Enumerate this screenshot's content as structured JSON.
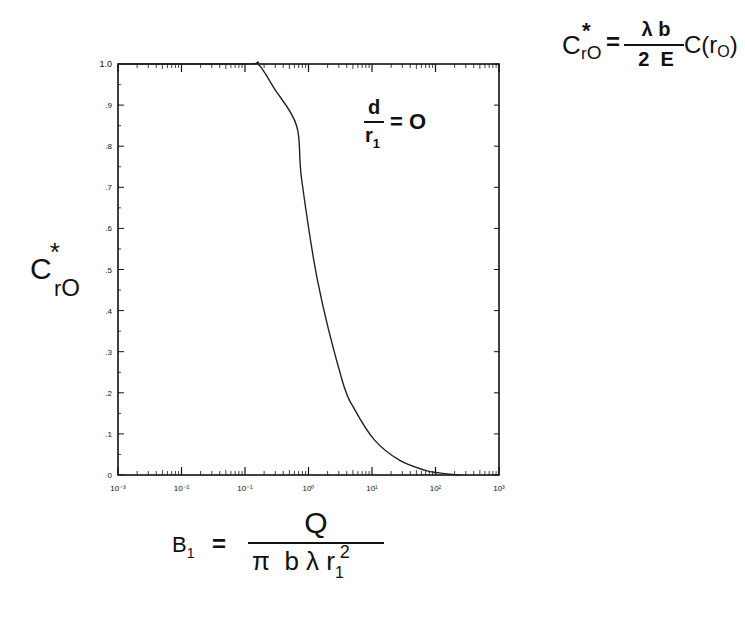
{
  "chart_data": {
    "type": "line",
    "title": "",
    "xscale": "log",
    "xlim": [
      0.001,
      1000
    ],
    "ylim": [
      0,
      1.0
    ],
    "xlabel": "β1 = Q / (π b λ r1²)",
    "ylabel": "C*ro",
    "x_ticks": [
      "10⁻³",
      "10⁻²",
      "10⁻¹",
      "10⁰",
      "10¹",
      "10²",
      "10³"
    ],
    "x_tick_values": [
      0.001,
      0.01,
      0.1,
      1,
      10,
      100,
      1000
    ],
    "y_ticks": [
      "0",
      ".1",
      ".2",
      ".3",
      ".4",
      ".5",
      ".6",
      ".7",
      ".8",
      ".9",
      "1.0"
    ],
    "y_tick_values": [
      0,
      0.1,
      0.2,
      0.3,
      0.4,
      0.5,
      0.6,
      0.7,
      0.8,
      0.9,
      1.0
    ],
    "grid": false,
    "legend": null,
    "annotations": [
      "d/r1 = 0",
      "C*ro = (λ b / 2 E) C(ro)"
    ],
    "series": [
      {
        "name": "d/r1 = 0",
        "x": [
          0.001,
          0.1,
          0.16,
          0.29,
          0.65,
          0.78,
          1.4,
          3.4,
          5.3,
          11,
          27,
          67,
          115,
          250
        ],
        "y": [
          1.0,
          1.0,
          1.0,
          0.94,
          0.85,
          0.72,
          0.47,
          0.23,
          0.16,
          0.085,
          0.036,
          0.012,
          0.005,
          0.0
        ]
      }
    ]
  },
  "labels": {
    "y_axis": {
      "base": "C",
      "sup": "*",
      "sub": "r",
      "subsub": "O"
    },
    "parameter": {
      "num": "d",
      "den": "r",
      "den_sub": "1",
      "eq": "= O"
    },
    "definition": {
      "lhs_base": "C",
      "lhs_sup": "*",
      "lhs_sub": "r",
      "lhs_subsub": "O",
      "eq": "=",
      "num": "λ b",
      "den": "2  E",
      "rhs": "C(r",
      "rhs_sub": "O",
      "rhs_close": ")"
    },
    "x_axis": {
      "lhs": "B",
      "lhs_sub": "1",
      "eq": "=",
      "num": "Q",
      "den_main": "π  b λ r",
      "den_sub": "1",
      "den_sup": "2"
    }
  }
}
